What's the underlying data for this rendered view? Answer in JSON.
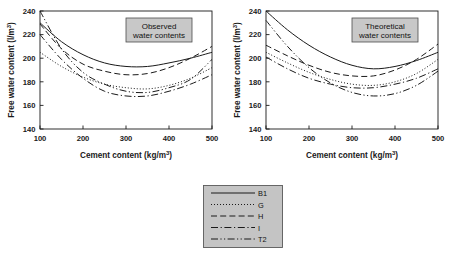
{
  "figure": {
    "background": "#ffffff",
    "line_color": "#1a1a1a",
    "label_box_fill": "#c8c8c8",
    "label_box_border": "#4d4d4d",
    "legend_box_fill": "#c4c4c4",
    "legend_box_border": "#5a5a5a"
  },
  "axes": {
    "xlabel": "Cement content (kg/m",
    "xlabel_sup": "3",
    "xlabel_tail": ")",
    "ylabel": "Free water content  (l/m",
    "ylabel_sup": "3",
    "ylabel_tail": ")",
    "xticks": [
      "100",
      "200",
      "300",
      "400",
      "500"
    ],
    "yticks": [
      "140",
      "160",
      "180",
      "200",
      "220",
      "240"
    ],
    "xlim": [
      100,
      500
    ],
    "ylim": [
      140,
      240
    ]
  },
  "panels": [
    {
      "id": "observed",
      "title_line1": "Observed",
      "title_line2": "water contents"
    },
    {
      "id": "theoretical",
      "title_line1": "Theoretical",
      "title_line2": "water contents"
    }
  ],
  "legend": {
    "items": [
      {
        "label": "B1",
        "dash": "none"
      },
      {
        "label": "G",
        "dash": "dotted"
      },
      {
        "label": "H",
        "dash": "dashed"
      },
      {
        "label": "I",
        "dash": "dashdot"
      },
      {
        "label": "T2",
        "dash": "dashdotdot"
      }
    ]
  },
  "chart_data": [
    {
      "type": "line",
      "title": "Observed water contents",
      "xlabel": "Cement content (kg/m3)",
      "ylabel": "Free water content (l/m3)",
      "xlim": [
        100,
        500
      ],
      "ylim": [
        140,
        240
      ],
      "xticks": [
        100,
        200,
        300,
        400,
        500
      ],
      "yticks": [
        140,
        160,
        180,
        200,
        220,
        240
      ],
      "grid": false,
      "legend_position": "below-figure",
      "x": [
        100,
        150,
        200,
        250,
        300,
        350,
        400,
        450,
        500
      ],
      "series": [
        {
          "name": "B1",
          "dash": "none",
          "values": [
            230,
            214,
            203,
            196,
            193,
            193,
            196,
            200,
            205
          ]
        },
        {
          "name": "G",
          "dash": "dotted",
          "values": [
            205,
            193,
            184,
            178,
            175,
            174,
            177,
            183,
            192
          ]
        },
        {
          "name": "H",
          "dash": "dashed",
          "values": [
            229,
            208,
            195,
            189,
            186,
            187,
            192,
            200,
            210
          ]
        },
        {
          "name": "I",
          "dash": "dashdot",
          "values": [
            220,
            199,
            183,
            172,
            168,
            168,
            172,
            178,
            186
          ]
        },
        {
          "name": "T2",
          "dash": "dashdotdot",
          "values": [
            240,
            208,
            188,
            178,
            172,
            171,
            175,
            182,
            199
          ]
        }
      ]
    },
    {
      "type": "line",
      "title": "Theoretical water contents",
      "xlabel": "Cement content (kg/m3)",
      "ylabel": "Free water content (l/m3)",
      "xlim": [
        100,
        500
      ],
      "ylim": [
        140,
        240
      ],
      "xticks": [
        100,
        200,
        300,
        400,
        500
      ],
      "yticks": [
        140,
        160,
        180,
        200,
        220,
        240
      ],
      "grid": false,
      "legend_position": "below-figure",
      "x": [
        100,
        150,
        200,
        250,
        300,
        350,
        400,
        450,
        500
      ],
      "series": [
        {
          "name": "B1",
          "dash": "none",
          "values": [
            240,
            224,
            211,
            201,
            194,
            191,
            193,
            198,
            205
          ]
        },
        {
          "name": "G",
          "dash": "dotted",
          "values": [
            205,
            196,
            188,
            182,
            178,
            177,
            180,
            187,
            199
          ]
        },
        {
          "name": "H",
          "dash": "dashed",
          "values": [
            211,
            202,
            194,
            188,
            185,
            185,
            190,
            199,
            212
          ]
        },
        {
          "name": "I",
          "dash": "dashdot",
          "values": [
            201,
            191,
            183,
            178,
            175,
            175,
            178,
            183,
            191
          ]
        },
        {
          "name": "T2",
          "dash": "dashdotdot",
          "values": [
            232,
            210,
            192,
            179,
            171,
            168,
            170,
            177,
            189
          ]
        }
      ]
    }
  ]
}
